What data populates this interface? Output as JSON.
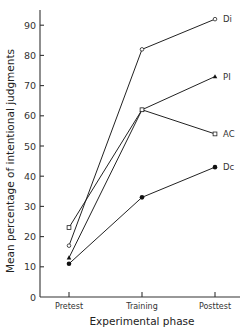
{
  "chart_data": {
    "type": "line",
    "title": "",
    "xlabel": "Experimental phase",
    "ylabel": "Mean percentage of intentional judgments",
    "categories": [
      "Pretest",
      "Training",
      "Posttest"
    ],
    "ylim": [
      0,
      95
    ],
    "yticks": [
      0,
      10,
      20,
      30,
      40,
      50,
      60,
      70,
      80,
      90
    ],
    "grid": false,
    "legend_position": "inline-right",
    "series": [
      {
        "name": "Di",
        "marker": "open-circle",
        "values": [
          17,
          82,
          92
        ]
      },
      {
        "name": "PI",
        "marker": "filled-triangle",
        "values": [
          13,
          62,
          73
        ]
      },
      {
        "name": "AC",
        "marker": "open-square",
        "values": [
          23,
          62,
          54
        ]
      },
      {
        "name": "Dc",
        "marker": "filled-circle",
        "values": [
          11,
          33,
          43
        ]
      }
    ]
  }
}
